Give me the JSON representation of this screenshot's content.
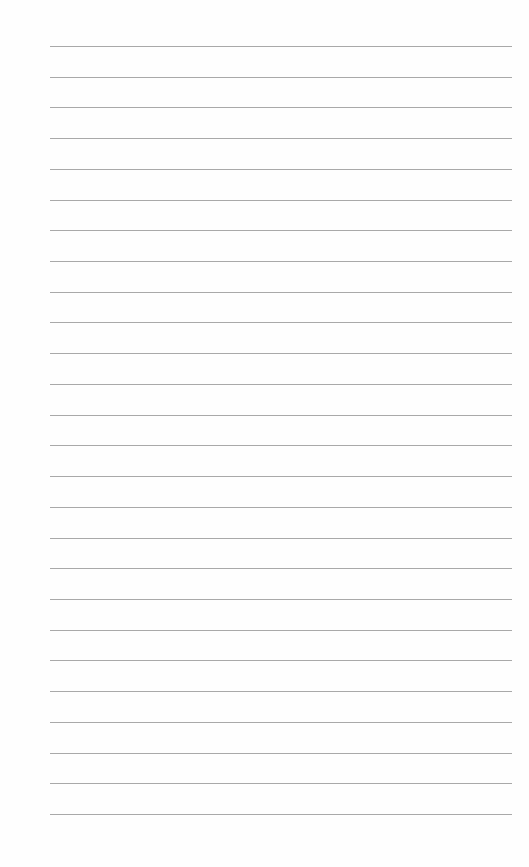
{
  "document": {
    "type": "ruled-paper",
    "line_count": 26,
    "line_color": "#a9a9a9",
    "background_color": "#fefefe",
    "first_line_y": 46,
    "line_spacing": 30.72,
    "line_left": 50,
    "line_right": 512,
    "text": []
  }
}
